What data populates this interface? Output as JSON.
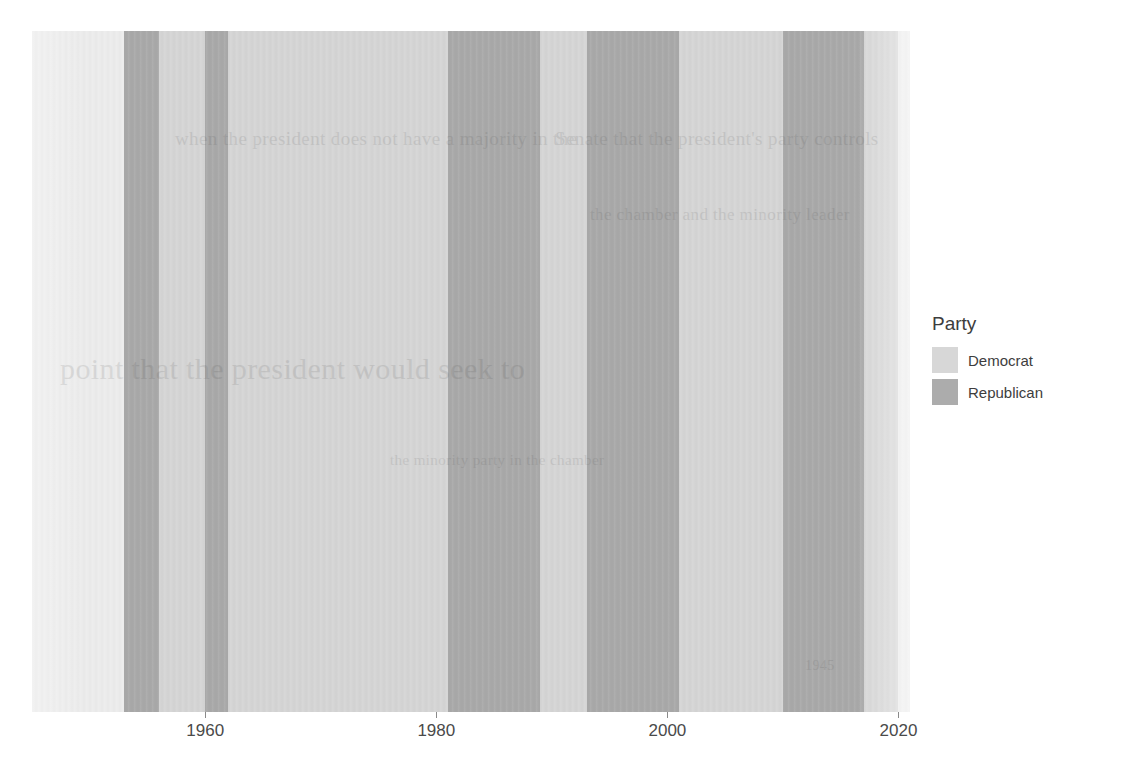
{
  "chart_data": {
    "type": "bar",
    "title": "",
    "subtitle": "",
    "xlabel": "",
    "ylabel": "",
    "orientation": "horizontal-timeline",
    "grid": false,
    "legend_position": "right",
    "xlim": [
      1945,
      2021
    ],
    "x_ticks": [
      1960,
      1980,
      2000,
      2020
    ],
    "x_tick_labels": [
      "1960",
      "1980",
      "2000",
      "2020"
    ],
    "legend_title": "Party",
    "series": [
      {
        "name": "Democrat",
        "color": "#d5d5d5"
      },
      {
        "name": "Republican",
        "color": "#a9a9a9"
      }
    ],
    "bands": [
      {
        "start": 1945,
        "end": 1953,
        "party": "Democrat",
        "shade": "pale"
      },
      {
        "start": 1953,
        "end": 1956,
        "party": "Republican",
        "shade": "normal"
      },
      {
        "start": 1956,
        "end": 1960,
        "party": "Democrat",
        "shade": "normal"
      },
      {
        "start": 1960,
        "end": 1962,
        "party": "Republican",
        "shade": "normal"
      },
      {
        "start": 1962,
        "end": 1981,
        "party": "Democrat",
        "shade": "normal"
      },
      {
        "start": 1981,
        "end": 1989,
        "party": "Republican",
        "shade": "normal"
      },
      {
        "start": 1989,
        "end": 1993,
        "party": "Democrat",
        "shade": "normal"
      },
      {
        "start": 1993,
        "end": 2001,
        "party": "Republican",
        "shade": "normal"
      },
      {
        "start": 2001,
        "end": 2010,
        "party": "Democrat",
        "shade": "normal"
      },
      {
        "start": 2010,
        "end": 2017,
        "party": "Republican",
        "shade": "normal"
      },
      {
        "start": 2017,
        "end": 2020,
        "party": "Democrat",
        "shade": "normal"
      },
      {
        "start": 2020,
        "end": 2021,
        "party": "Democrat",
        "shade": "pale"
      }
    ]
  },
  "legend": {
    "title": "Party",
    "items": [
      {
        "label": "Democrat",
        "color": "#d7d7d7"
      },
      {
        "label": "Republican",
        "color": "#acacac"
      }
    ]
  },
  "axis": {
    "ticks": [
      {
        "value": 1960,
        "label": "1960"
      },
      {
        "value": 1980,
        "label": "1980"
      },
      {
        "value": 2000,
        "label": "2000"
      },
      {
        "value": 2020,
        "label": "2020"
      }
    ]
  },
  "ghost_text": {
    "lines": [
      {
        "text": "when the president does not have a majority in the",
        "x": 175,
        "y": 128,
        "size": 19
      },
      {
        "text": "Senate that the president's party controls",
        "x": 555,
        "y": 128,
        "size": 19
      },
      {
        "text": "the chamber and the minority leader",
        "x": 590,
        "y": 205,
        "size": 17
      },
      {
        "text": "point that the president would seek to",
        "x": 60,
        "y": 352,
        "size": 30
      },
      {
        "text": "the minority party in the chamber",
        "x": 390,
        "y": 452,
        "size": 15
      },
      {
        "text": "1945",
        "x": 805,
        "y": 658,
        "size": 14
      }
    ]
  }
}
